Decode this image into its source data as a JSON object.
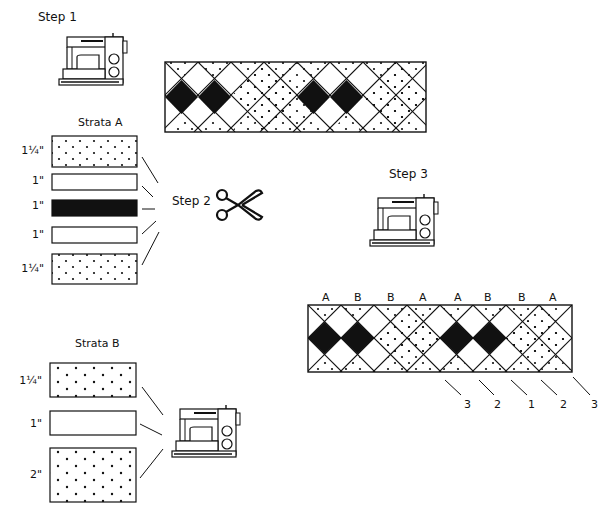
{
  "steps": {
    "step1": "Step 1",
    "step2": "Step 2",
    "step3": "Step 3"
  },
  "strata_a": {
    "title": "Strata A",
    "strips": [
      {
        "width": "1¼\"",
        "fill": "dotted"
      },
      {
        "width": "1\"",
        "fill": "white"
      },
      {
        "width": "1\"",
        "fill": "black"
      },
      {
        "width": "1\"",
        "fill": "white"
      },
      {
        "width": "1¼\"",
        "fill": "dotted"
      }
    ]
  },
  "strata_b": {
    "title": "Strata B",
    "strips": [
      {
        "width": "1¼\"",
        "fill": "dotted"
      },
      {
        "width": "1\"",
        "fill": "white"
      },
      {
        "width": "2\"",
        "fill": "dotted"
      }
    ]
  },
  "border_band": {
    "segment_labels": [
      "A",
      "B",
      "B",
      "A",
      "A",
      "B",
      "B",
      "A"
    ],
    "row_numbers": [
      "3",
      "2",
      "1",
      "2",
      "3"
    ]
  },
  "icons": [
    "sewing-machine-icon",
    "scissors-icon"
  ],
  "colors": {
    "ink": "#111111",
    "paper": "#ffffff"
  }
}
